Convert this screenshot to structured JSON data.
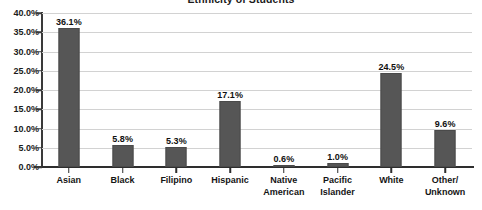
{
  "chart_data": {
    "type": "bar",
    "title": "Ethnicity of Students",
    "xlabel": "",
    "ylabel": "",
    "ylim": [
      0,
      40
    ],
    "grid": true,
    "legend": "none",
    "bar_color": "#565656",
    "gridline_color": "#d2d2d2",
    "axis_color": "#2e2e2e",
    "background": "#ffffff",
    "ytick_labels": [
      "40.0%",
      "35.0%",
      "30.0%",
      "25.0%",
      "20.0%",
      "15.0%",
      "10.0%",
      "5.0%",
      "0.0%"
    ],
    "ytick_values": [
      40,
      35,
      30,
      25,
      20,
      15,
      10,
      5,
      0
    ],
    "categories": [
      "Asian",
      "Black",
      "Filipino",
      "Hispanic",
      "Native American",
      "Pacific Islander",
      "White",
      "Other/ Unknown"
    ],
    "category_lines": [
      [
        "Asian"
      ],
      [
        "Black"
      ],
      [
        "Filipino"
      ],
      [
        "Hispanic"
      ],
      [
        "Native",
        "American"
      ],
      [
        "Pacific",
        "Islander"
      ],
      [
        "White"
      ],
      [
        "Other/",
        "Unknown"
      ]
    ],
    "values": [
      36.1,
      5.8,
      5.3,
      17.1,
      0.6,
      1.0,
      24.5,
      9.6
    ],
    "data_labels": [
      "36.1%",
      "5.8%",
      "5.3%",
      "17.1%",
      "0.6%",
      "1.0%",
      "24.5%",
      "9.6%"
    ]
  }
}
